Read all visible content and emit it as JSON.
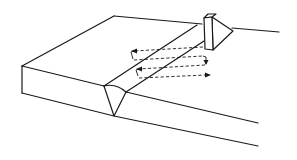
{
  "diagram": {
    "colors": {
      "line": "#1a1a1a",
      "background": "#ffffff"
    },
    "components": [
      {
        "name": "base-plate",
        "description": "Rectangular plate in perspective view"
      },
      {
        "name": "v-groove-weld",
        "description": "V-shaped weld bead along the plate"
      },
      {
        "name": "angle-probe",
        "description": "Ultrasonic angle-beam probe sitting on plate surface"
      },
      {
        "name": "raster-scan-path",
        "description": "Dashed zig-zag scanning path with arrows"
      }
    ],
    "scan_passes": 4
  }
}
